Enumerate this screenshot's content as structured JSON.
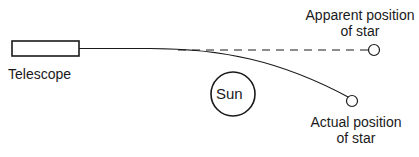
{
  "diagram": {
    "telescope": {
      "label": "Telescope"
    },
    "sun": {
      "label": "Sun"
    },
    "apparent_star": {
      "label_line1": "Apparent position",
      "label_line2": "of star"
    },
    "actual_star": {
      "label_line1": "Actual position",
      "label_line2": "of star"
    },
    "colors": {
      "stroke": "#1a1a1a",
      "background": "#ffffff"
    }
  }
}
